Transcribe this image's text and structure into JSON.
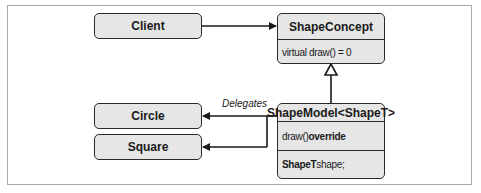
{
  "diagram": {
    "nodes": {
      "client": {
        "label": "Client"
      },
      "shape_concept": {
        "title": "ShapeConcept",
        "members": [
          {
            "text": "virtual draw() = 0"
          }
        ]
      },
      "shape_model": {
        "title": "ShapeModel<ShapeT>",
        "members": [
          {
            "prefix": "draw()",
            "suffix": " override"
          },
          {
            "prefix": "ShapeT",
            "suffix": " shape;"
          }
        ]
      },
      "circle": {
        "label": "Circle"
      },
      "square": {
        "label": "Square"
      }
    },
    "edges": [
      {
        "from": "Client",
        "to": "ShapeConcept",
        "type": "association"
      },
      {
        "from": "ShapeModel<ShapeT>",
        "to": "ShapeConcept",
        "type": "inheritance"
      },
      {
        "from": "ShapeModel<ShapeT>",
        "to": "Circle",
        "type": "association",
        "label": "Delegates"
      },
      {
        "from": "ShapeModel<ShapeT>",
        "to": "Square",
        "type": "association"
      }
    ],
    "delegates_label": "Delegates"
  }
}
